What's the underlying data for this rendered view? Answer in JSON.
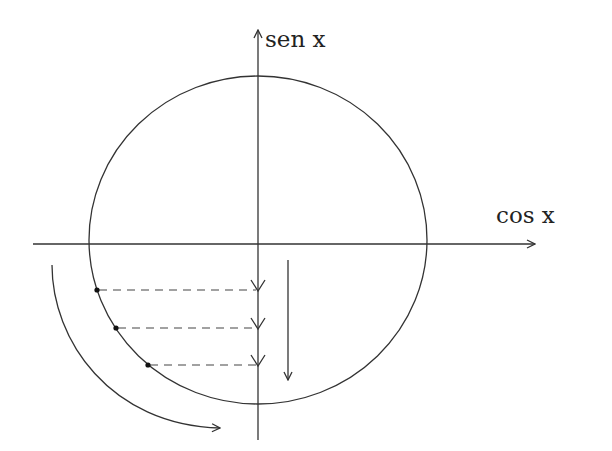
{
  "diagram": {
    "type": "unit-circle",
    "labels": {
      "vertical_axis": "sen x",
      "horizontal_axis": "cos x"
    },
    "colors": {
      "stroke": "#333333",
      "background": "#ffffff"
    },
    "circle": {
      "cx": 258,
      "cy": 240,
      "rx": 169,
      "ry": 164
    },
    "axes": {
      "horizontal": {
        "x1": 33,
        "x2": 535,
        "y": 244
      },
      "vertical": {
        "x": 258,
        "y1": 30,
        "y2": 440
      }
    },
    "points": [
      {
        "x": 97,
        "y": 290
      },
      {
        "x": 116,
        "y": 328
      },
      {
        "x": 148,
        "y": 365
      }
    ],
    "projection_arrow": {
      "x": 288,
      "y1": 260,
      "y2": 380,
      "direction": "down"
    },
    "rotation_arrow": {
      "start": [
        52,
        265
      ],
      "end": [
        220,
        428
      ],
      "direction": "clockwise"
    }
  }
}
